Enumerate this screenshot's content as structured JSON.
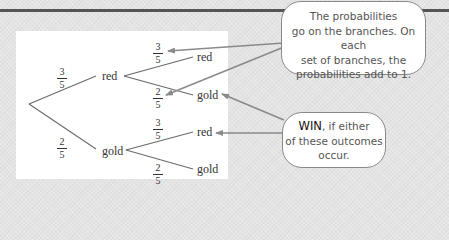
{
  "tree": {
    "root": "",
    "level1": [
      {
        "label": "red",
        "probability": {
          "num": "3",
          "den": "5"
        }
      },
      {
        "label": "gold",
        "probability": {
          "num": "2",
          "den": "5"
        }
      }
    ],
    "level2": [
      {
        "parent": "red",
        "label": "red",
        "probability": {
          "num": "3",
          "den": "5"
        }
      },
      {
        "parent": "red",
        "label": "gold",
        "probability": {
          "num": "2",
          "den": "5"
        }
      },
      {
        "parent": "gold",
        "label": "red",
        "probability": {
          "num": "3",
          "den": "5"
        }
      },
      {
        "parent": "gold",
        "label": "gold",
        "probability": {
          "num": "2",
          "den": "5"
        }
      }
    ]
  },
  "callouts": {
    "probabilities": {
      "lines": [
        "The probabilities",
        "go on the branches. On each",
        "set of branches, the",
        "probabilities add to 1."
      ]
    },
    "win": {
      "emphasis": "WIN",
      "line1_rest": ", if either",
      "line2": "of these outcomes",
      "line3": "occur."
    }
  },
  "colors": {
    "background": "#e4e4e4",
    "panel": "#ffffff",
    "line": "#6a6a6a",
    "arrow": "#8a8a8a",
    "text": "#333333"
  }
}
